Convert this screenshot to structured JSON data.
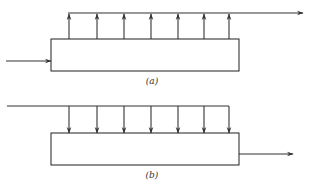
{
  "figure": {
    "panels": [
      {
        "id": "a",
        "label": "(a)",
        "description": "Single inlet on left of vessel, distributed outlets from top feeding a common outlet header flowing right",
        "box": {
          "x": 51,
          "y": 39,
          "width": 188,
          "height": 32
        },
        "header": {
          "y": 13,
          "x_start": 68,
          "x_end": 303,
          "direction": "right"
        },
        "branch_arrows": {
          "x": [
            69,
            97,
            124,
            151,
            178,
            204,
            229
          ],
          "direction": "up"
        },
        "side_arrow": {
          "y": 61,
          "x_start": 6,
          "x_end": 51,
          "role": "inlet"
        }
      },
      {
        "id": "b",
        "label": "(b)",
        "description": "Distributed inlets from a common feed header entering top of vessel, single outlet on right",
        "box": {
          "x": 51,
          "y": 133,
          "width": 188,
          "height": 32
        },
        "header": {
          "y": 106,
          "x_start": 7,
          "x_end": 229,
          "direction": "none"
        },
        "branch_arrows": {
          "x": [
            69,
            97,
            124,
            151,
            178,
            204,
            229
          ],
          "direction": "down"
        },
        "side_arrow": {
          "y": 154,
          "x_start": 239,
          "x_end": 293,
          "role": "outlet"
        }
      }
    ],
    "stroke_color": "#333333"
  }
}
